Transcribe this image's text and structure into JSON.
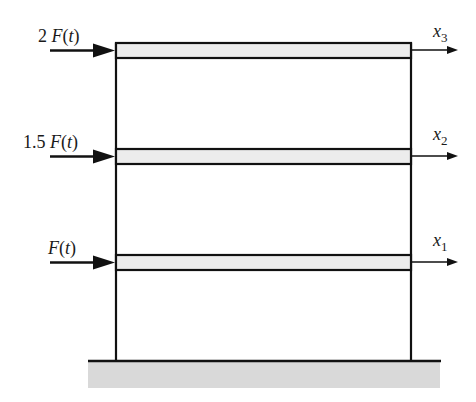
{
  "diagram": {
    "notation": {
      "open": "(",
      "close": ")"
    },
    "colors": {
      "line": "#111111",
      "beam_fill": "#ececec",
      "ground_fill": "#d9d9d9",
      "background": "#ffffff"
    },
    "floors": [
      {
        "level": 3,
        "force": {
          "label": "2 F(t)",
          "coefficient": "2",
          "symbol": "F",
          "argument": "t"
        },
        "displacement": {
          "label": "x3",
          "symbol": "x",
          "subscript": "3"
        }
      },
      {
        "level": 2,
        "force": {
          "label": "1.5 F(t)",
          "coefficient": "1.5",
          "symbol": "F",
          "argument": "t"
        },
        "displacement": {
          "label": "x2",
          "symbol": "x",
          "subscript": "2"
        }
      },
      {
        "level": 1,
        "force": {
          "label": "F(t)",
          "coefficient": "",
          "symbol": "F",
          "argument": "t"
        },
        "displacement": {
          "label": "x1",
          "symbol": "x",
          "subscript": "1"
        }
      }
    ],
    "ground": {
      "label": "fixed ground"
    }
  }
}
